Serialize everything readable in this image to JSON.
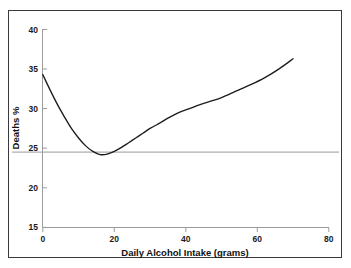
{
  "chart_data": {
    "type": "line",
    "title": "",
    "xlabel": "Daily Alcohol Intake (grams)",
    "ylabel": "Deaths %",
    "xlim": [
      0,
      80
    ],
    "ylim": [
      15,
      40
    ],
    "xticks": [
      0,
      20,
      40,
      60,
      80
    ],
    "yticks": [
      15,
      20,
      25,
      30,
      35,
      40
    ],
    "xtick_labels": [
      "0",
      "20",
      "40",
      "60",
      "80"
    ],
    "ytick_labels": [
      "15",
      "20",
      "25",
      "30",
      "35",
      "40"
    ],
    "grid": false,
    "legend": "none",
    "reference_line": {
      "orientation": "horizontal",
      "value": 24.5,
      "color": "#9b9b9b"
    },
    "series": [
      {
        "name": "Deaths %",
        "color": "#1c1c1c",
        "x": [
          0,
          2,
          4,
          6,
          8,
          10,
          12,
          14,
          16,
          18,
          20,
          22,
          24,
          26,
          28,
          30,
          32,
          33,
          35,
          38,
          41,
          44,
          47,
          50,
          54,
          58,
          62,
          66,
          70
        ],
        "y": [
          34.3,
          32.4,
          30.6,
          29.0,
          27.5,
          26.3,
          25.3,
          24.6,
          24.2,
          24.25,
          24.6,
          25.1,
          25.7,
          26.3,
          26.9,
          27.5,
          28.0,
          28.25,
          28.8,
          29.5,
          30.0,
          30.5,
          30.95,
          31.4,
          32.2,
          33.0,
          33.9,
          35.0,
          36.3
        ]
      }
    ],
    "annotations": []
  },
  "axis": {
    "x_title": "Daily Alcohol Intake (grams)",
    "y_title": "Deaths %",
    "x_labels": [
      "0",
      "20",
      "40",
      "60",
      "80"
    ],
    "y_labels": [
      "40",
      "35",
      "30",
      "25",
      "20",
      "15"
    ]
  },
  "colors": {
    "curve": "#1c1c1c",
    "spine": "#9b9b9b",
    "reference_line": "#9b9b9b",
    "frame_border": "#3a3a3a",
    "background": "#ffffff",
    "text": "#111111"
  }
}
